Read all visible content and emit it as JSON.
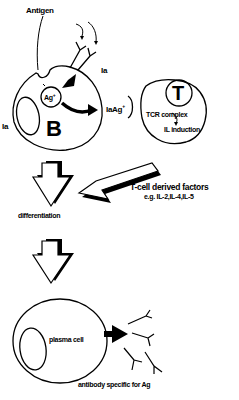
{
  "labels": {
    "antigen": "Antigen",
    "ia_top": "Ia",
    "ia_left": "Ia",
    "ag_plus": "Ag",
    "plus": "+",
    "b_cell": "B",
    "ia_ag_plus": "IaAg",
    "t_cell": "T",
    "tcr_complex": "TCR complex",
    "il_induction": "IL induction",
    "t_cell_factors": "T-cell derived factors",
    "factors_examples": "e.g. IL-2,IL-4,IL-5",
    "differentiation": "differentiation",
    "plasma_cell": "plasma cell",
    "antibody_specific": "antibody specific for Ag"
  },
  "colors": {
    "ink": "#000000",
    "background": "#ffffff"
  }
}
